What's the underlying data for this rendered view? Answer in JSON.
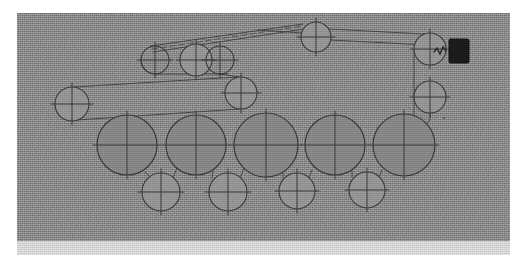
{
  "document": {
    "kind": "scanned-engineering-figure",
    "subject": "belt-and-pulley roller drive train",
    "caption": "",
    "has_text_labels": false,
    "note": "no legible text or numerals appear anywhere in the scanned figure"
  },
  "canvas": {
    "width": 523,
    "height": 273,
    "page_background": "#ffffff"
  },
  "scan_plate": {
    "x": 17,
    "y": 13,
    "width": 493,
    "height": 228,
    "fill": "#a9a9a9",
    "texture": "halftone-photocopy-grain",
    "bottom_band": {
      "x": 17,
      "y": 241,
      "width": 493,
      "height": 14,
      "fill": "#e3e3e3"
    }
  },
  "colors": {
    "background_gray": "#a9a9a9",
    "paper_white": "#ffffff",
    "roller_fill": "#8e8e8e",
    "pulley_fill": "#9d9d9d",
    "stroke": "#3d3d3d",
    "belt_stroke": "#4a4a4a",
    "motor_block": "#1d1d1d",
    "bottom_band": "#e3e3e3"
  },
  "geometry": {
    "stroke_width": 1.1,
    "belt_width": 1.0,
    "crosshair_overhang": 4
  },
  "rollers": [
    {
      "id": "roller-1",
      "cx": 127,
      "cy": 145,
      "r": 30,
      "label": "large roller 1"
    },
    {
      "id": "roller-2",
      "cx": 196,
      "cy": 145,
      "r": 30,
      "label": "large roller 2"
    },
    {
      "id": "roller-3",
      "cx": 266,
      "cy": 145,
      "r": 32,
      "label": "large roller 3"
    },
    {
      "id": "roller-4",
      "cx": 335,
      "cy": 145,
      "r": 30,
      "label": "large roller 4"
    },
    {
      "id": "roller-5",
      "cx": 404,
      "cy": 145,
      "r": 31,
      "label": "large roller 5"
    }
  ],
  "pulleys": [
    {
      "id": "pulley-top-left-a",
      "cx": 155,
      "cy": 60,
      "r": 14,
      "fill": "none",
      "label": "upper idler A"
    },
    {
      "id": "pulley-top-left-b",
      "cx": 196,
      "cy": 60,
      "r": 16,
      "fill": "shaded",
      "label": "upper drive pulley B"
    },
    {
      "id": "pulley-top-left-c",
      "cx": 220,
      "cy": 60,
      "r": 14,
      "fill": "none",
      "label": "upper idler C"
    },
    {
      "id": "pulley-top-center",
      "cx": 316,
      "cy": 37,
      "r": 15,
      "fill": "shaded",
      "label": "top tension pulley"
    },
    {
      "id": "pulley-mid-left",
      "cx": 72,
      "cy": 104,
      "r": 17,
      "fill": "shaded",
      "label": "left guide pulley"
    },
    {
      "id": "pulley-mid-center",
      "cx": 241,
      "cy": 93,
      "r": 16,
      "fill": "shaded",
      "label": "centre idler pulley"
    },
    {
      "id": "pulley-right-upper",
      "cx": 430,
      "cy": 49,
      "r": 16,
      "fill": "shaded",
      "label": "motor output pulley"
    },
    {
      "id": "pulley-right-lower",
      "cx": 430,
      "cy": 97,
      "r": 16,
      "fill": "shaded",
      "label": "right transfer pulley"
    },
    {
      "id": "pulley-bot-1",
      "cx": 161,
      "cy": 192,
      "r": 19,
      "fill": "shaded",
      "label": "lower nip roller 1"
    },
    {
      "id": "pulley-bot-2",
      "cx": 228,
      "cy": 192,
      "r": 19,
      "fill": "shaded",
      "label": "lower nip roller 2"
    },
    {
      "id": "pulley-bot-3",
      "cx": 297,
      "cy": 191,
      "r": 18,
      "fill": "shaded",
      "label": "lower nip roller 3"
    },
    {
      "id": "pulley-bot-4",
      "cx": 367,
      "cy": 190,
      "r": 18,
      "fill": "shaded",
      "label": "lower nip roller 4"
    }
  ],
  "motor": {
    "id": "motor-block",
    "x": 449,
    "y": 39,
    "width": 20,
    "height": 24,
    "fill": "#1d1d1d",
    "label": "drive motor / gearbox block"
  },
  "coupling": {
    "id": "motor-coupling",
    "label": "flexible coupling between motor block and pulley",
    "path": "M 446 51 L 443 47 L 440 54 L 437 48 L 434 52"
  },
  "belts": [
    {
      "id": "belt-upper-long",
      "label": "long upper belt, top-left cluster to top-centre pulley"
    },
    {
      "id": "belt-upper-return",
      "label": "return run of upper belt"
    },
    {
      "id": "belt-cluster-lower",
      "label": "lower run of top-left pulley cluster"
    },
    {
      "id": "belt-left-long",
      "label": "long belt from left guide pulley to centre idler"
    },
    {
      "id": "belt-top-right",
      "label": "belt from top-centre pulley to motor output pulley"
    },
    {
      "id": "belt-right-vert",
      "label": "vertical belt down right-hand side to roller 5"
    },
    {
      "id": "belt-roller-nips",
      "label": "tangent contact lines between large rollers and lower nip rollers"
    }
  ],
  "tooling": {
    "zoom_level": "100%",
    "visible_controls": []
  }
}
